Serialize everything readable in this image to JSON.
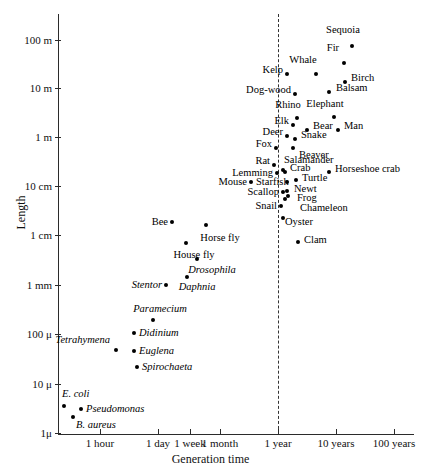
{
  "chart_data": {
    "type": "scatter",
    "title": "",
    "xlabel": "Generation time",
    "ylabel": "Length",
    "xscale": "log",
    "yscale": "log",
    "grid": false,
    "legend": null,
    "xticks": [
      "1 hour",
      "1 day",
      "1 week",
      "1 month",
      "1 year",
      "10 years",
      "100 years"
    ],
    "yticks": [
      "100 m",
      "10 m",
      "1 m",
      "10 cm",
      "1 cm",
      "1 mm",
      "100 μ",
      "10 μ",
      "1μ"
    ],
    "annotations": [
      {
        "name": "reference-line",
        "kind": "vertical-dashed",
        "at": "1 year"
      }
    ],
    "points": [
      {
        "label": "Sequoia",
        "italic": false,
        "x": 352,
        "y": 46,
        "lx": 343,
        "ly": 30,
        "anchor": "center"
      },
      {
        "label": "Fir",
        "italic": false,
        "x": 344,
        "y": 63,
        "lx": 333,
        "ly": 48,
        "anchor": "center"
      },
      {
        "label": "Birch",
        "italic": false,
        "x": 345,
        "y": 82,
        "lx": 351,
        "ly": 78,
        "anchor": "left"
      },
      {
        "label": "Whale",
        "italic": false,
        "x": 316,
        "y": 74,
        "lx": 303,
        "ly": 60,
        "anchor": "center"
      },
      {
        "label": "Balsam",
        "italic": false,
        "x": 329,
        "y": 92,
        "lx": 336,
        "ly": 88,
        "anchor": "left"
      },
      {
        "label": "Kelp",
        "italic": false,
        "x": 287,
        "y": 74,
        "lx": 283,
        "ly": 70,
        "anchor": "right"
      },
      {
        "label": "Dog-wood",
        "italic": false,
        "x": 295,
        "y": 94,
        "lx": 291,
        "ly": 90,
        "anchor": "right"
      },
      {
        "label": "Rhino",
        "italic": false,
        "x": 297,
        "y": 118,
        "lx": 288,
        "ly": 105,
        "anchor": "center"
      },
      {
        "label": "Elephant",
        "italic": false,
        "x": 334,
        "y": 117,
        "lx": 325,
        "ly": 104,
        "anchor": "center"
      },
      {
        "label": "Elk",
        "italic": false,
        "x": 293,
        "y": 125,
        "lx": 289,
        "ly": 121,
        "anchor": "right"
      },
      {
        "label": "Bear",
        "italic": false,
        "x": 307,
        "y": 130,
        "lx": 313,
        "ly": 126,
        "anchor": "left"
      },
      {
        "label": "Man",
        "italic": false,
        "x": 338,
        "y": 130,
        "lx": 344,
        "ly": 126,
        "anchor": "left"
      },
      {
        "label": "Deer",
        "italic": false,
        "x": 287,
        "y": 136,
        "lx": 283,
        "ly": 132,
        "anchor": "right"
      },
      {
        "label": "Snake",
        "italic": false,
        "x": 295,
        "y": 139,
        "lx": 301,
        "ly": 135,
        "anchor": "left"
      },
      {
        "label": "Fox",
        "italic": false,
        "x": 276,
        "y": 148,
        "lx": 272,
        "ly": 144,
        "anchor": "right"
      },
      {
        "label": "Beaver",
        "italic": false,
        "x": 293,
        "y": 148,
        "lx": 299,
        "ly": 155,
        "anchor": "left"
      },
      {
        "label": "Rat",
        "italic": false,
        "x": 274,
        "y": 165,
        "lx": 270,
        "ly": 161,
        "anchor": "right"
      },
      {
        "label": "Salamander",
        "italic": false,
        "x": 283,
        "y": 170,
        "lx": 284,
        "ly": 160,
        "anchor": "left"
      },
      {
        "label": "Lemming",
        "italic": false,
        "x": 277,
        "y": 173,
        "lx": 273,
        "ly": 173,
        "anchor": "right"
      },
      {
        "label": "Crab",
        "italic": false,
        "x": 285,
        "y": 172,
        "lx": 290,
        "ly": 168,
        "anchor": "left"
      },
      {
        "label": "Horseshoe crab",
        "italic": false,
        "x": 329,
        "y": 172,
        "lx": 335,
        "ly": 169,
        "anchor": "left"
      },
      {
        "label": "Mouse",
        "italic": false,
        "x": 251,
        "y": 182,
        "lx": 247,
        "ly": 182,
        "anchor": "right"
      },
      {
        "label": "Starfish",
        "italic": false,
        "x": 287,
        "y": 182,
        "lx": 256,
        "ly": 182,
        "anchor": "left"
      },
      {
        "label": "Turtle",
        "italic": false,
        "x": 296,
        "y": 180,
        "lx": 302,
        "ly": 178,
        "anchor": "left"
      },
      {
        "label": "Newt",
        "italic": false,
        "x": 287,
        "y": 191,
        "lx": 294,
        "ly": 189,
        "anchor": "left"
      },
      {
        "label": "Scallop",
        "italic": false,
        "x": 283,
        "y": 192,
        "lx": 279,
        "ly": 192,
        "anchor": "right"
      },
      {
        "label": "Frog",
        "italic": false,
        "x": 285,
        "y": 199,
        "lx": 297,
        "ly": 198,
        "anchor": "left"
      },
      {
        "label": "Chameleon",
        "italic": false,
        "x": 288,
        "y": 196,
        "lx": 300,
        "ly": 208,
        "anchor": "left"
      },
      {
        "label": "Snail",
        "italic": false,
        "x": 281,
        "y": 206,
        "lx": 277,
        "ly": 206,
        "anchor": "right"
      },
      {
        "label": "Oyster",
        "italic": false,
        "x": 283,
        "y": 218,
        "lx": 285,
        "ly": 222,
        "anchor": "left"
      },
      {
        "label": "Bee",
        "italic": false,
        "x": 172,
        "y": 222,
        "lx": 168,
        "ly": 222,
        "anchor": "right"
      },
      {
        "label": "Horse fly",
        "italic": false,
        "x": 206,
        "y": 225,
        "lx": 220,
        "ly": 238,
        "anchor": "center"
      },
      {
        "label": "Clam",
        "italic": false,
        "x": 298,
        "y": 242,
        "lx": 304,
        "ly": 240,
        "anchor": "left"
      },
      {
        "label": "House fly",
        "italic": false,
        "x": 186,
        "y": 243,
        "lx": 194,
        "ly": 255,
        "anchor": "center"
      },
      {
        "label": "Drosophila",
        "italic": true,
        "x": 197,
        "y": 259,
        "lx": 212,
        "ly": 270,
        "anchor": "center"
      },
      {
        "label": "Daphnia",
        "italic": true,
        "x": 187,
        "y": 277,
        "lx": 197,
        "ly": 287,
        "anchor": "center"
      },
      {
        "label": "Stentor",
        "italic": true,
        "x": 166,
        "y": 285,
        "lx": 162,
        "ly": 285,
        "anchor": "right"
      },
      {
        "label": "Paramecium",
        "italic": true,
        "x": 153,
        "y": 320,
        "lx": 160,
        "ly": 309,
        "anchor": "center"
      },
      {
        "label": "Didinium",
        "italic": true,
        "x": 134,
        "y": 333,
        "lx": 139,
        "ly": 333,
        "anchor": "left"
      },
      {
        "label": "Tetrahymena",
        "italic": true,
        "x": 116,
        "y": 350,
        "lx": 110,
        "ly": 340,
        "anchor": "right"
      },
      {
        "label": "Euglena",
        "italic": true,
        "x": 134,
        "y": 351,
        "lx": 139,
        "ly": 351,
        "anchor": "left"
      },
      {
        "label": "Spirochaeta",
        "italic": true,
        "x": 137,
        "y": 367,
        "lx": 142,
        "ly": 367,
        "anchor": "left"
      },
      {
        "label": "E. coli",
        "italic": true,
        "x": 64,
        "y": 406,
        "lx": 62,
        "ly": 394,
        "anchor": "left"
      },
      {
        "label": "Pseudomonas",
        "italic": true,
        "x": 81,
        "y": 409,
        "lx": 86,
        "ly": 409,
        "anchor": "left"
      },
      {
        "label": "B. aureus",
        "italic": true,
        "x": 73,
        "y": 417,
        "lx": 76,
        "ly": 425,
        "anchor": "left"
      }
    ]
  },
  "axes": {
    "y": {
      "label": "Length",
      "ticks": [
        {
          "text": "100 m",
          "pos": 40
        },
        {
          "text": "10 m",
          "pos": 88
        },
        {
          "text": "1 m",
          "pos": 137
        },
        {
          "text": "10 cm",
          "pos": 186
        },
        {
          "text": "1 cm",
          "pos": 235
        },
        {
          "text": "1 mm",
          "pos": 285
        },
        {
          "text": "100 μ",
          "pos": 334
        },
        {
          "text": "10 μ",
          "pos": 384
        },
        {
          "text": "1μ",
          "pos": 433
        }
      ]
    },
    "x": {
      "label": "Generation time",
      "ticks": [
        {
          "text": "1 hour",
          "pos": 100
        },
        {
          "text": "1 day",
          "pos": 158
        },
        {
          "text": "1 week",
          "pos": 190
        },
        {
          "text": "1 month",
          "pos": 220
        },
        {
          "text": "1 year",
          "pos": 278
        },
        {
          "text": "10 years",
          "pos": 336
        },
        {
          "text": "100 years",
          "pos": 394
        }
      ]
    }
  }
}
